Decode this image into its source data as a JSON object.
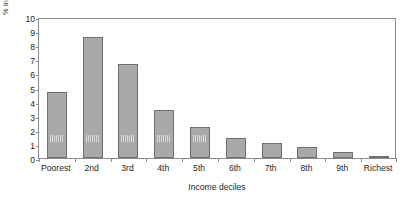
{
  "chart_data": {
    "type": "bar",
    "title": "",
    "xlabel": "Income deciles",
    "ylabel": "% increase in disposable income",
    "categories": [
      "Poorest",
      "2nd",
      "3rd",
      "4th",
      "5th",
      "6th",
      "7th",
      "8th",
      "9th",
      "Richest"
    ],
    "values": [
      4.65,
      8.6,
      6.7,
      3.4,
      2.2,
      1.4,
      1.1,
      0.8,
      0.45,
      0.15
    ],
    "ylim": [
      0,
      10
    ],
    "ytick_labels": [
      "10",
      "9",
      "8",
      "7",
      "6",
      "5",
      "4",
      "3",
      "2",
      "1",
      "0"
    ],
    "ytick_values": [
      10,
      9,
      8,
      7,
      6,
      5,
      4,
      3,
      2,
      1,
      0
    ],
    "grid": false,
    "legend": null,
    "bar_color": "#a9a9a9",
    "bar_border_color": "#6f6f71",
    "axis_color": "#8b8b8e",
    "text_color": "#231f20"
  }
}
